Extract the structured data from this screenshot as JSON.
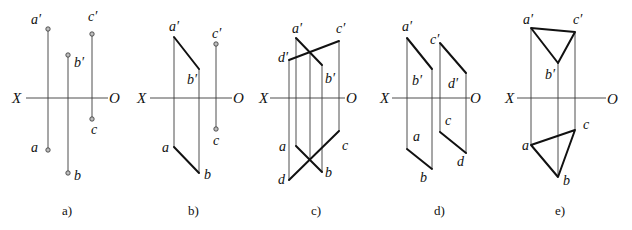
{
  "figure": {
    "axis_labels": {
      "left": "X",
      "right": "O"
    },
    "panels": [
      {
        "caption": "a)",
        "labels": {
          "a_prime": "a′",
          "b_prime": "b′",
          "c_prime": "c′",
          "a": "a",
          "b": "b",
          "c": "c"
        }
      },
      {
        "caption": "b)",
        "labels": {
          "a_prime": "a′",
          "b_prime": "b′",
          "c_prime": "c′",
          "a": "a",
          "b": "b",
          "c": "c"
        }
      },
      {
        "caption": "c)",
        "labels": {
          "a_prime": "a′",
          "b_prime": "b′",
          "c_prime": "c′",
          "d_prime": "d′",
          "a": "a",
          "b": "b",
          "c": "c",
          "d": "d"
        }
      },
      {
        "caption": "d)",
        "labels": {
          "a_prime": "a′",
          "b_prime": "b′",
          "c_prime": "c′",
          "d_prime": "d′",
          "a": "a",
          "b": "b",
          "c": "c",
          "d": "d"
        }
      },
      {
        "caption": "e)",
        "labels": {
          "a_prime": "a′",
          "b_prime": "b′",
          "c_prime": "c′",
          "a": "a",
          "b": "b",
          "c": "c"
        }
      }
    ]
  }
}
